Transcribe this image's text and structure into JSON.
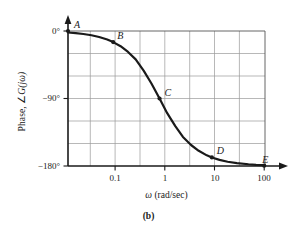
{
  "caption": "(b)",
  "axes": {
    "ylabel_prefix": "Phase, ",
    "ylabel_symbol": "∠",
    "ylabel_func": "G(jω)",
    "xlabel_symbol": "ω",
    "xlabel_units": " (rad/sec)",
    "y_ticks": [
      "0°",
      "−90°",
      "−180°"
    ],
    "x_ticks": [
      "0.1",
      "1",
      "10",
      "100"
    ]
  },
  "point_labels": {
    "A": "A",
    "B": "B",
    "C": "C",
    "D": "D",
    "E": "E"
  },
  "colors": {
    "curve": "#1a1a1a",
    "axis": "#1a1a1a",
    "grid": "#9a9a9a",
    "background": "#ffffff"
  },
  "chart_data": {
    "type": "line",
    "title": "(b)",
    "xlabel": "ω (rad/sec)",
    "ylabel": "Phase, ∠G(jω)",
    "xscale": "log",
    "xlim": [
      0.0178,
      100
    ],
    "ylim": [
      -180,
      0
    ],
    "yticks": [
      0,
      -90,
      -180
    ],
    "ytick_labels": [
      "0°",
      "−90°",
      "−180°"
    ],
    "xticks": [
      0.1,
      1,
      10,
      100
    ],
    "xtick_labels": [
      "0.1",
      "1",
      "10",
      "100"
    ],
    "grid": true,
    "grid_x_minor_decade_fraction": 0.5,
    "grid_y_step_deg": 30,
    "legend": "none",
    "series": [
      {
        "name": "Phase of G(jω)",
        "comment": "Two-pole phase curve, asymptotes 0° and -180°, -90° at ω=1",
        "x": [
          0.0178,
          0.025,
          0.035,
          0.05,
          0.07,
          0.1,
          0.13,
          0.18,
          0.25,
          0.35,
          0.5,
          0.7,
          1.0,
          1.4,
          2.0,
          2.8,
          4.0,
          5.6,
          8.0,
          10.0,
          14.0,
          20.0,
          30.0,
          50.0,
          70.0,
          100.0
        ],
        "y": [
          -2.0,
          -2.9,
          -4.0,
          -5.7,
          -8.0,
          -11.4,
          -14.8,
          -20.3,
          -27.9,
          -37.8,
          -53.1,
          -70.0,
          -90.0,
          -109.6,
          -126.9,
          -141.3,
          -152.0,
          -159.7,
          -165.8,
          -168.6,
          -171.8,
          -174.3,
          -176.2,
          -177.7,
          -178.4,
          -178.9
        ],
        "style": "solid",
        "width": 2.2,
        "color": "#1a1a1a"
      }
    ],
    "annotations": [
      {
        "label": "A",
        "x": 0.0178,
        "y": 0.0,
        "marker": true,
        "text_offset": [
          6,
          -12
        ]
      },
      {
        "label": "B",
        "x": 0.13,
        "y": -14.8,
        "marker": true,
        "text_offset": [
          4,
          -12
        ]
      },
      {
        "label": "C",
        "x": 1.0,
        "y": -90.0,
        "marker": true,
        "text_offset": [
          5,
          -12
        ]
      },
      {
        "label": "D",
        "x": 10.0,
        "y": -168.6,
        "marker": true,
        "text_offset": [
          5,
          -12
        ]
      },
      {
        "label": "E",
        "x": 100.0,
        "y": -179.5,
        "marker": true,
        "text_offset": [
          -2,
          -12
        ]
      }
    ]
  }
}
